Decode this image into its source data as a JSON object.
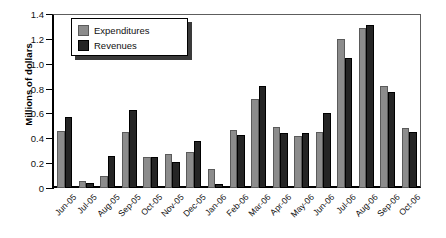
{
  "chart_data": {
    "type": "bar",
    "title": "",
    "xlabel": "",
    "ylabel": "Millions of dollars",
    "ylim": [
      0,
      1.4
    ],
    "yticks": [
      "0",
      "0.2",
      "0.4",
      "0.6",
      "0.8",
      "1.0",
      "1.2",
      "1.4"
    ],
    "ytick_values": [
      0,
      0.2,
      0.4,
      0.6,
      0.8,
      1.0,
      1.2,
      1.4
    ],
    "grid": false,
    "legend_position": "top-left",
    "categories": [
      "Jun-05",
      "Jul-05",
      "Aug-05",
      "Sep-05",
      "Oct-05",
      "Nov-05",
      "Dec-05",
      "Jan-06",
      "Feb-06",
      "Mar-06",
      "Apr-06",
      "May-06",
      "Jun-06",
      "Jul-06",
      "Aug-06",
      "Sep-06",
      "Oct-06"
    ],
    "series": [
      {
        "name": "Expenditures",
        "color": "#8c8c8c",
        "values": [
          0.46,
          0.06,
          0.1,
          0.45,
          0.25,
          0.27,
          0.29,
          0.15,
          0.47,
          0.72,
          0.49,
          0.42,
          0.45,
          1.2,
          1.29,
          0.82,
          0.48
        ]
      },
      {
        "name": "Revenues",
        "color": "#252525",
        "values": [
          0.57,
          0.04,
          0.26,
          0.63,
          0.25,
          0.21,
          0.38,
          0.03,
          0.43,
          0.82,
          0.44,
          0.44,
          0.6,
          1.05,
          1.31,
          0.77,
          0.45
        ]
      }
    ]
  },
  "legend": {
    "items": [
      {
        "label": "Expenditures",
        "swatch": "expenditures"
      },
      {
        "label": "Revenues",
        "swatch": "revenues"
      }
    ]
  }
}
